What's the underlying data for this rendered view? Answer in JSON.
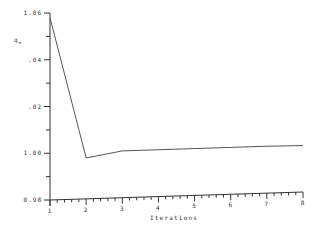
{
  "chart_data": {
    "type": "line",
    "title": "",
    "xlabel": "Iterations",
    "ylabel": "q_e",
    "x": [
      1,
      2,
      3,
      4,
      5,
      6,
      7,
      8
    ],
    "series": [
      {
        "name": "q_e",
        "values": [
          1.058,
          0.998,
          1.001,
          1.0015,
          1.002,
          1.0025,
          1.003,
          1.0033
        ]
      }
    ],
    "xlim": [
      1,
      8
    ],
    "ylim": [
      0.98,
      1.06
    ],
    "x_ticks": [
      "1",
      "2",
      "3",
      "4",
      "5",
      "6",
      "7",
      "8"
    ],
    "y_ticks": [
      {
        "value": 1.06,
        "label": "1.06"
      },
      {
        "value": 1.04,
        "label": ".04"
      },
      {
        "value": 1.02,
        "label": ".02"
      },
      {
        "value": 1.0,
        "label": "1.00"
      },
      {
        "value": 0.98,
        "label": "0.98"
      }
    ],
    "grid": false,
    "legend": "none",
    "line_color": "#555555",
    "axis_color": "#333333"
  }
}
